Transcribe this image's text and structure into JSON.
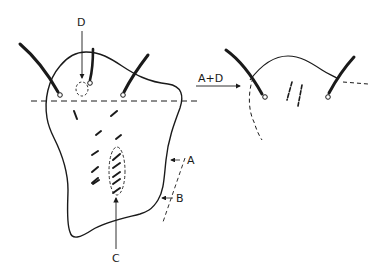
{
  "figure": {
    "labels": {
      "d": "D",
      "a": "A",
      "b": "B",
      "c": "C",
      "transition": "A+D"
    },
    "colors": {
      "ink": "#1a1a1a",
      "background": "#ffffff"
    }
  }
}
